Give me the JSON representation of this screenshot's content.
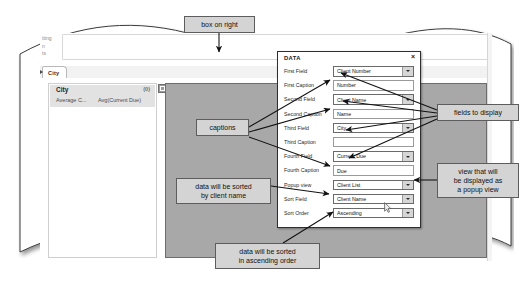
{
  "app": {
    "toolbar_hint_lines": [
      "tting",
      "n",
      "ts"
    ],
    "tab_label": "City"
  },
  "list_panel": {
    "title": "City",
    "count": "(0)",
    "column_1": "Average C...",
    "column_2": "Avg(Current Due)"
  },
  "dialog": {
    "title": "DATA",
    "close_label": "×",
    "rows": [
      {
        "label": "First Field",
        "value": "Client Number",
        "type": "dropdown"
      },
      {
        "label": "First Caption",
        "value": "Number",
        "type": "text"
      },
      {
        "label": "Second Field",
        "value": "Client Name",
        "type": "dropdown"
      },
      {
        "label": "Second Caption",
        "value": "Name",
        "type": "text"
      },
      {
        "label": "Third Field",
        "value": "City",
        "type": "dropdown"
      },
      {
        "label": "Third Caption",
        "value": "",
        "type": "text"
      },
      {
        "label": "Fourth Field",
        "value": "Current Due",
        "type": "dropdown"
      },
      {
        "label": "Fourth Caption",
        "value": "Due",
        "type": "text"
      },
      {
        "label": "Popup view",
        "value": "Client List",
        "type": "dropdown"
      },
      {
        "label": "Sort Field",
        "value": "Client Name",
        "type": "dropdown"
      },
      {
        "label": "Sort Order",
        "value": "Ascending",
        "type": "dropdown"
      }
    ]
  },
  "annotations": {
    "box_on_right": "box on right",
    "captions": "captions",
    "sorted_by_client_name": "data will be sorted\nby client name",
    "sorted_ascending": "data will be sorted\nin ascending order",
    "fields_to_display": "fields to display",
    "popup_view": "view that will\nbe displayed as\na popup view"
  },
  "colors": {
    "callout_fill": "#d4d4d4",
    "callout_border": "#5d5d5d",
    "grey_area": "#a8a8a8",
    "list_header": "#e2e2e2",
    "dialog_border": "#2f2f2f"
  }
}
